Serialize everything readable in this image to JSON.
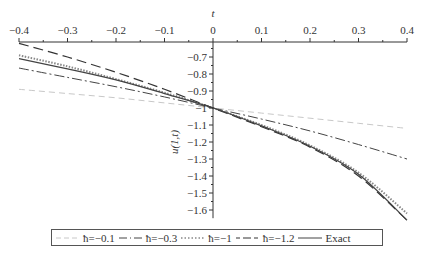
{
  "chart_data": {
    "type": "line",
    "title": "",
    "xlabel": "t",
    "ylabel": "u(1,t)",
    "xlim": [
      -0.4,
      0.4
    ],
    "ylim": [
      -1.66,
      -0.61
    ],
    "x_axis_position": "top",
    "y_axis_position": "at t=0",
    "grid": false,
    "legend_placement": "bottom",
    "x_ticks": [
      -0.4,
      -0.3,
      -0.2,
      -0.1,
      0,
      0.1,
      0.2,
      0.3,
      0.4
    ],
    "x_tick_labels": [
      "−0.4",
      "−0.3",
      "−0.2",
      "−0.1",
      "0",
      "0.1",
      "0.2",
      "0.3",
      "0.4"
    ],
    "y_ticks": [
      -0.7,
      -0.8,
      -0.9,
      -1,
      -1.1,
      -1.2,
      -1.3,
      -1.4,
      -1.5,
      -1.6
    ],
    "y_tick_labels": [
      "−0.7",
      "−0.8",
      "−0.9",
      "−1",
      "−1.1",
      "−1.2",
      "−1.3",
      "−1.4",
      "−1.5",
      "−1.6"
    ],
    "x": [
      -0.4,
      -0.3,
      -0.2,
      -0.1,
      0,
      0.1,
      0.2,
      0.3,
      0.4
    ],
    "series": [
      {
        "name": "ħ=−0.1",
        "style": "dashed",
        "color": "#c8c8c8",
        "values": [
          -0.89,
          -0.915,
          -0.94,
          -0.97,
          -1.0,
          -1.03,
          -1.06,
          -1.09,
          -1.12
        ]
      },
      {
        "name": "ħ=−0.3",
        "style": "dashdot",
        "color": "#444444",
        "values": [
          -0.765,
          -0.82,
          -0.875,
          -0.935,
          -1.0,
          -1.065,
          -1.135,
          -1.215,
          -1.3
        ]
      },
      {
        "name": "ħ=−1",
        "style": "dotted",
        "color": "#888888",
        "values": [
          -0.69,
          -0.755,
          -0.83,
          -0.91,
          -1.0,
          -1.1,
          -1.22,
          -1.38,
          -1.62
        ]
      },
      {
        "name": "ħ=−1.2",
        "style": "longdash",
        "color": "#333333",
        "values": [
          -0.62,
          -0.7,
          -0.79,
          -0.89,
          -1.0,
          -1.11,
          -1.23,
          -1.4,
          -1.66
        ]
      },
      {
        "name": "Exact",
        "style": "solid",
        "color": "#444444",
        "values": [
          -0.71,
          -0.77,
          -0.835,
          -0.915,
          -1.0,
          -1.105,
          -1.225,
          -1.39,
          -1.66
        ]
      }
    ]
  },
  "legend": {
    "items": [
      {
        "label": "ħ=−0.1"
      },
      {
        "label": "ħ=−0.3"
      },
      {
        "label": "ħ=−1"
      },
      {
        "label": "ħ=−1.2"
      },
      {
        "label": "Exact"
      }
    ]
  }
}
